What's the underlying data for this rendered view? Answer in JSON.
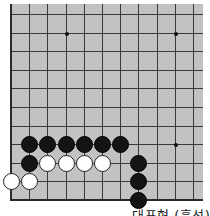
{
  "diagram": {
    "caption": "대표형 (흑선)",
    "colors": {
      "board": "#c2c2c2",
      "line": "#3a3a3a",
      "black_stone": "#141414",
      "white_stone": "#ffffff"
    },
    "grid": {
      "origin_x": 11,
      "origin_y": 14,
      "spacing_x": 18.2,
      "spacing_y": 18.6,
      "columns": 11,
      "rows": 11,
      "left_edge": true,
      "bottom_edge": true
    },
    "star_points": [
      {
        "col": 3,
        "row": 1
      },
      {
        "col": 9,
        "row": 1
      },
      {
        "col": 9,
        "row": 7
      }
    ],
    "stones": [
      {
        "color": "black",
        "col": 1,
        "row": 7
      },
      {
        "color": "black",
        "col": 2,
        "row": 7
      },
      {
        "color": "black",
        "col": 3,
        "row": 7
      },
      {
        "color": "black",
        "col": 4,
        "row": 7
      },
      {
        "color": "black",
        "col": 5,
        "row": 7
      },
      {
        "color": "black",
        "col": 6,
        "row": 7
      },
      {
        "color": "black",
        "col": 1,
        "row": 8
      },
      {
        "color": "white",
        "col": 2,
        "row": 8
      },
      {
        "color": "white",
        "col": 3,
        "row": 8
      },
      {
        "color": "white",
        "col": 4,
        "row": 8
      },
      {
        "color": "white",
        "col": 5,
        "row": 8
      },
      {
        "color": "black",
        "col": 7,
        "row": 8
      },
      {
        "color": "white",
        "col": 0,
        "row": 9
      },
      {
        "color": "white",
        "col": 1,
        "row": 9
      },
      {
        "color": "black",
        "col": 7,
        "row": 9
      },
      {
        "color": "black",
        "col": 7,
        "row": 10
      }
    ]
  }
}
